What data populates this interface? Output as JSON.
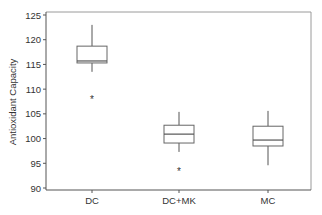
{
  "chart_data": {
    "type": "boxplot",
    "title": "",
    "xlabel": "",
    "ylabel": "Antioxidant Capacity",
    "ylim": [
      90,
      125
    ],
    "yticks": [
      90,
      95,
      100,
      105,
      110,
      115,
      120,
      125
    ],
    "grid": false,
    "legend": null,
    "categories": [
      "DC",
      "DC+MK",
      "MC"
    ],
    "series": [
      {
        "name": "DC",
        "whisker_low": 113.5,
        "q1": 115.3,
        "median": 115.7,
        "q3": 118.7,
        "whisker_high": 123.0,
        "outliers": [
          108.0
        ]
      },
      {
        "name": "DC+MK",
        "whisker_low": 97.3,
        "q1": 99.1,
        "median": 100.9,
        "q3": 102.7,
        "whisker_high": 105.4,
        "outliers": [
          93.4
        ]
      },
      {
        "name": "MC",
        "whisker_low": 94.6,
        "q1": 98.5,
        "median": 99.7,
        "q3": 102.5,
        "whisker_high": 105.6,
        "outliers": []
      }
    ],
    "outlier_marker": "*"
  }
}
